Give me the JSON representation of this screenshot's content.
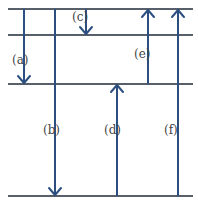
{
  "diagram": {
    "title": "",
    "levels": [
      {
        "name": "level-1",
        "order": 1
      },
      {
        "name": "level-2",
        "order": 2
      },
      {
        "name": "level-3",
        "order": 3
      },
      {
        "name": "level-4",
        "order": 4
      }
    ],
    "transitions": [
      {
        "label": "(a)",
        "from": 1,
        "to": 3,
        "direction": "down"
      },
      {
        "label": "(b)",
        "from": 1,
        "to": 4,
        "direction": "down"
      },
      {
        "label": "(c)",
        "from": 1,
        "to": 2,
        "direction": "down"
      },
      {
        "label": "(d)",
        "from": 4,
        "to": 3,
        "direction": "up"
      },
      {
        "label": "(e)",
        "from": 3,
        "to": 1,
        "direction": "up"
      },
      {
        "label": "(f)",
        "from": 4,
        "to": 1,
        "direction": "up"
      }
    ],
    "colors": {
      "arrow": "#2d4f7f",
      "level_line": "#1f2a3a",
      "label": "#444444"
    }
  }
}
